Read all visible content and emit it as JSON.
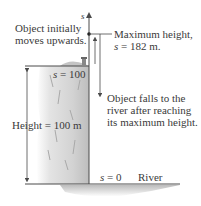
{
  "diagram": {
    "axis_label": "s",
    "initial_motion": {
      "line1": "Object initially",
      "line2": "moves upwards."
    },
    "max_height": {
      "line1": "Maximum height,",
      "line2_var": "s",
      "line2_rest": " = 182 m."
    },
    "cliff_top": {
      "var": "s",
      "rest": " = 100"
    },
    "falls": {
      "line1": "Object falls to the",
      "line2": "river after reaching",
      "line3": "its maximum height."
    },
    "height": {
      "label": "Height = 100 m"
    },
    "ground": {
      "var": "s",
      "rest": " = 0",
      "river": "River"
    },
    "colors": {
      "line": "#4a4a4a",
      "cliff": "#cfcfcf",
      "text": "#3a3a3a"
    }
  }
}
